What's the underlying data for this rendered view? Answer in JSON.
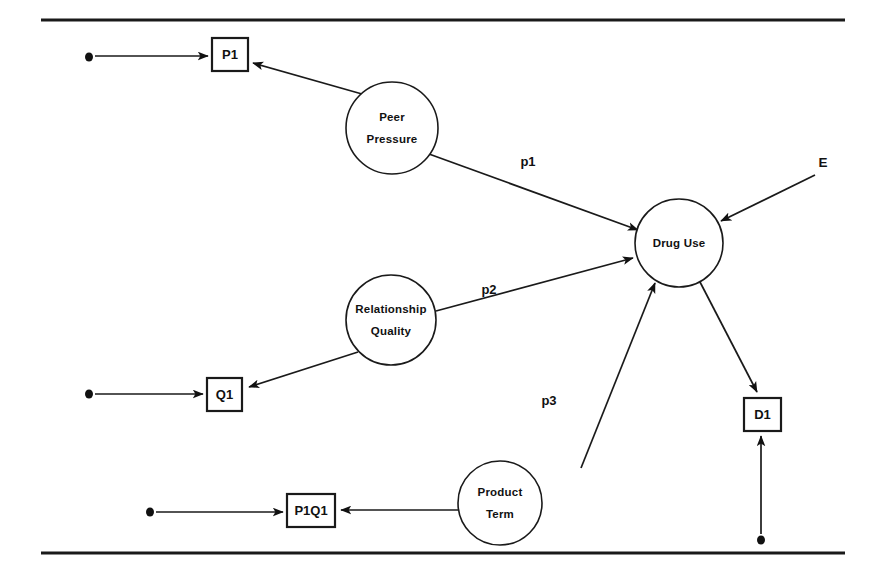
{
  "figure": {
    "background_color": "#ffffff",
    "ink_color": "#1a1a1a",
    "width": 876,
    "height": 582
  },
  "rules": {
    "top_rule_label": "top-horizontal-rule",
    "bottom_rule_label": "bottom-horizontal-rule"
  },
  "latent_nodes": [
    {
      "id": "peer_pressure",
      "label_line1": "Peer",
      "label_line2": "Pressure",
      "cx": 392,
      "cy": 128,
      "r": 46
    },
    {
      "id": "drug_use",
      "label_line1": "Drug Use",
      "label_line2": "",
      "cx": 679,
      "cy": 243,
      "r": 44
    },
    {
      "id": "relationship_quality",
      "label_line1": "Relationship",
      "label_line2": "Quality",
      "cx": 391,
      "cy": 320,
      "r": 45
    },
    {
      "id": "product_term",
      "label_line1": "Product",
      "label_line2": "Term",
      "cx": 500,
      "cy": 503,
      "r": 42
    }
  ],
  "observed_nodes": [
    {
      "id": "p1",
      "label": "P1",
      "x": 212,
      "y": 38,
      "w": 36,
      "h": 33
    },
    {
      "id": "q1",
      "label": "Q1",
      "x": 207,
      "y": 378,
      "w": 35,
      "h": 33
    },
    {
      "id": "p1q1",
      "label": "P1Q1",
      "x": 287,
      "y": 494,
      "w": 48,
      "h": 33
    },
    {
      "id": "d1",
      "label": "D1",
      "x": 744,
      "y": 398,
      "w": 37,
      "h": 33
    }
  ],
  "path_labels": [
    {
      "id": "p1_path",
      "text": "p1",
      "x": 528,
      "y": 163
    },
    {
      "id": "p2_path",
      "text": "p2",
      "x": 489,
      "y": 291
    },
    {
      "id": "p3_path",
      "text": "p3",
      "x": 549,
      "y": 402
    }
  ],
  "disturbance_labels": [
    {
      "id": "e_label",
      "text": "E",
      "x": 823,
      "y": 163
    }
  ],
  "residual_dots": [
    {
      "id": "p1_residual_dot",
      "cx": 89,
      "cy": 57
    },
    {
      "id": "q1_residual_dot",
      "cx": 89,
      "cy": 394
    },
    {
      "id": "p1q1_residual_dot",
      "cx": 150,
      "cy": 512
    },
    {
      "id": "d1_residual_dot",
      "cx": 761,
      "cy": 540
    }
  ],
  "edges": [
    {
      "id": "residual-to-p1",
      "from": "p1_residual_dot",
      "to": "p1",
      "x1": 95,
      "y1": 56,
      "x2": 208,
      "y2": 56
    },
    {
      "id": "peer-pressure-to-p1",
      "from": "peer_pressure",
      "to": "p1",
      "x1": 362,
      "y1": 94,
      "x2": 253,
      "y2": 63
    },
    {
      "id": "peer-pressure-to-drug-use",
      "from": "peer_pressure",
      "to": "drug_use",
      "x1": 429,
      "y1": 154,
      "x2": 638,
      "y2": 230
    },
    {
      "id": "relationship-quality-to-drug-use",
      "from": "relationship_quality",
      "to": "drug_use",
      "x1": 436,
      "y1": 311,
      "x2": 633,
      "y2": 258
    },
    {
      "id": "relationship-quality-to-q1",
      "from": "relationship_quality",
      "to": "q1",
      "x1": 358,
      "y1": 352,
      "x2": 249,
      "y2": 387
    },
    {
      "id": "residual-to-q1",
      "from": "q1_residual_dot",
      "to": "q1",
      "x1": 95,
      "y1": 394,
      "x2": 203,
      "y2": 394
    },
    {
      "id": "product-term-to-drug-use",
      "from": "product_term",
      "to": "drug_use",
      "x1": 581,
      "y1": 468,
      "x2": 655,
      "y2": 283
    },
    {
      "id": "product-term-to-p1q1",
      "from": "product_term",
      "to": "p1q1",
      "x1": 458,
      "y1": 510,
      "x2": 341,
      "y2": 510
    },
    {
      "id": "residual-to-p1q1",
      "from": "p1q1_residual_dot",
      "to": "p1q1",
      "x1": 156,
      "y1": 512,
      "x2": 283,
      "y2": 512
    },
    {
      "id": "drug-use-to-d1",
      "from": "drug_use",
      "to": "d1",
      "x1": 700,
      "y1": 282,
      "x2": 757,
      "y2": 392
    },
    {
      "id": "residual-to-d1",
      "from": "d1_residual_dot",
      "to": "d1",
      "x1": 761,
      "y1": 534,
      "x2": 761,
      "y2": 436
    },
    {
      "id": "disturbance-to-drug-use",
      "from": "e_label",
      "to": "drug_use",
      "x1": 815,
      "y1": 175,
      "x2": 721,
      "y2": 221
    }
  ]
}
